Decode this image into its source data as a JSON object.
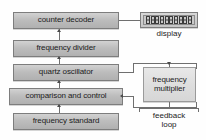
{
  "diagram": {
    "background_color": "#fefefe",
    "box_fill_color": "#bdbdbd",
    "box_light_fill_color": "#dedede",
    "box_border_color": "#7d7d7d",
    "connector_color": "#6f6f6f",
    "text_color": "#1c1c1c"
  },
  "blocks": {
    "counter_decoder": "counter decoder",
    "frequency_divider": "frequency divider",
    "quartz_oscillator": "quartz oscillator",
    "comparison_and_control": "comparison and control",
    "frequency_standard": "frequency standard",
    "frequency_multiplier": "frequency multiplier"
  },
  "display": {
    "digit_count": 10,
    "digit_value": "0",
    "digits": "0000000000",
    "caption": "display"
  },
  "feedback": {
    "caption_line1": "feedback",
    "caption_line2": "loop"
  },
  "icons": {
    "arrow_up": "arrow-up-icon",
    "arrow_right": "arrow-right-icon",
    "arrow_down": "arrow-down-icon"
  }
}
